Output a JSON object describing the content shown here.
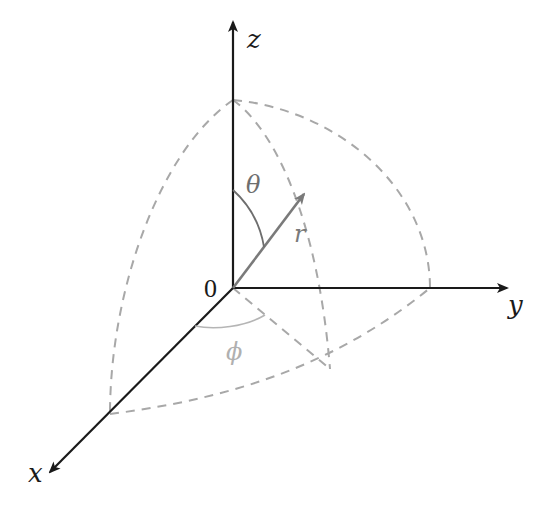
{
  "figure": {
    "axes": {
      "x": {
        "label": "x"
      },
      "y": {
        "label": "y"
      },
      "z": {
        "label": "z"
      },
      "origin": {
        "label": "0"
      }
    },
    "annotations": {
      "theta": {
        "label": "θ",
        "meaning": "polar angle from z-axis"
      },
      "phi": {
        "label": "ϕ",
        "meaning": "azimuthal angle from x-axis"
      },
      "r": {
        "label": "r",
        "meaning": "radial distance"
      }
    },
    "colors": {
      "axis": "#1a1a1a",
      "dashed": "#a8a8a8",
      "vector": "#7a7a7a",
      "theta_arc": "#6e6e6e",
      "phi_arc": "#b5b5b5",
      "phi_label": "#b0b0b0",
      "theta_label": "#6e6e6e",
      "r_label": "#7a7a7a"
    }
  }
}
